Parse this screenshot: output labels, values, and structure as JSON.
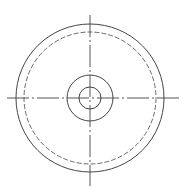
{
  "caption": "",
  "drawing": {
    "width": 184,
    "height": 190,
    "stroke_color": "#444444",
    "center": {
      "x": 90,
      "y": 98
    },
    "centerlines": {
      "horizontal": {
        "x1": 7,
        "x2": 179,
        "y": 98,
        "style": "dash-dot"
      },
      "vertical": {
        "y1": 15,
        "y2": 186,
        "x": 90,
        "style": "dash-dot"
      }
    },
    "circles": [
      {
        "name": "outer-rim",
        "r": 74,
        "style": "solid"
      },
      {
        "name": "pitch-circle",
        "r": 66,
        "style": "dashed"
      },
      {
        "name": "hub",
        "r": 23,
        "style": "solid"
      },
      {
        "name": "bore",
        "r": 11,
        "style": "solid"
      }
    ]
  }
}
